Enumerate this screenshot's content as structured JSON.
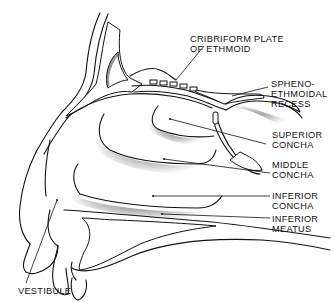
{
  "diagram": {
    "labels": {
      "cribriform": "CRIBRIFORM PLATE\nOF ETHMOID",
      "sphenoethmoidal": "SPHENO-\nETHMOIDAL\nRECESS",
      "superior_concha": "SUPERIOR\nCONCHA",
      "middle_concha": "MIDDLE\nCONCHA",
      "inferior_concha": "INFERIOR\nCONCHA",
      "inferior_meatus": "INFERIOR\nMEATUS",
      "vestibule": "VESTIBULE"
    },
    "colors": {
      "ink": "#111111",
      "background": "#ffffff",
      "shading": "#555555"
    }
  }
}
